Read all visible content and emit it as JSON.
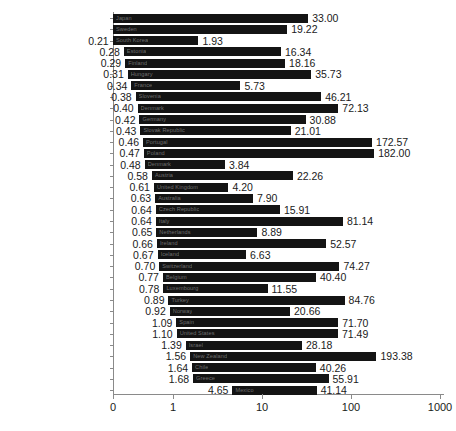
{
  "chart_data": {
    "type": "bar",
    "subtype": "floating-range-bar",
    "title": "",
    "xlabel": "",
    "ylabel": "",
    "orientation": "horizontal",
    "xscale": "log",
    "xlim": [
      0,
      1000
    ],
    "grid": false,
    "legend": null,
    "xticks": [
      {
        "label": "0",
        "value": 0,
        "px": 0
      },
      {
        "label": "1",
        "value": 1,
        "px": 60
      },
      {
        "label": "10",
        "value": 10,
        "px": 149
      },
      {
        "label": "100",
        "value": 100,
        "px": 238
      },
      {
        "label": "1000",
        "value": 1000,
        "px": 327
      }
    ],
    "categories": [
      "Japan",
      "Sweden",
      "South Korea",
      "Estonia",
      "Finland",
      "Hungary",
      "France",
      "Slovenia",
      "Canada",
      "Germany",
      "Slovak Republic",
      "Portugal",
      "Poland",
      "Denmark",
      "Austria",
      "United Kingdom",
      "Australia",
      "Czech Republic",
      "Italy",
      "Netherlands",
      "Ireland",
      "Iceland",
      "Switzerland",
      "Belgium",
      "Luxembourg",
      "Turkey",
      "Norway",
      "Spain",
      "United States",
      "Israel",
      "New Zealand",
      "Chile",
      "Greece",
      "Mexico"
    ],
    "series": [
      {
        "name": "Minimum",
        "values": [
          null,
          null,
          0.21,
          0.28,
          0.29,
          0.31,
          0.34,
          0.38,
          0.4,
          0.42,
          0.43,
          0.46,
          0.47,
          0.48,
          0.58,
          0.61,
          0.63,
          0.64,
          0.64,
          0.65,
          0.66,
          0.67,
          0.7,
          0.77,
          0.78,
          0.89,
          0.92,
          1.09,
          1.1,
          1.39,
          1.56,
          1.64,
          1.68,
          4.65
        ],
        "labels": [
          "",
          "",
          "0.21",
          "0.28",
          "0.29",
          "0.31",
          "0.34",
          "0.38",
          "0.40",
          "0.42",
          "0.43",
          "0.46",
          "0.47",
          "0.48",
          "0.58",
          "0.61",
          "0.63",
          "0.64",
          "0.64",
          "0.65",
          "0.66",
          "0.67",
          "0.70",
          "0.77",
          "0.78",
          "0.89",
          "0.92",
          "1.09",
          "1.10",
          "1.39",
          "1.56",
          "1.64",
          "1.68",
          "4.65"
        ]
      },
      {
        "name": "Maximum",
        "values": [
          33.0,
          19.22,
          1.93,
          16.34,
          18.16,
          35.73,
          5.73,
          46.21,
          72.13,
          30.88,
          21.01,
          172.57,
          182.0,
          3.84,
          22.26,
          4.2,
          7.9,
          15.91,
          81.14,
          8.89,
          52.57,
          6.63,
          74.27,
          40.4,
          11.55,
          84.76,
          20.66,
          71.7,
          71.49,
          28.18,
          193.38,
          40.26,
          55.91,
          41.14
        ],
        "labels": [
          "33.00",
          "19.22",
          "1.93",
          "16.34",
          "18.16",
          "35.73",
          "5.73",
          "46.21",
          "72.13",
          "30.88",
          "21.01",
          "172.57",
          "182.00",
          "3.84",
          "22.26",
          "4.20",
          "7.90",
          "15.91",
          "81.14",
          "8.89",
          "52.57",
          "6.63",
          "74.27",
          "40.40",
          "11.55",
          "84.76",
          "20.66",
          "71.70",
          "71.49",
          "28.18",
          "193.38",
          "40.26",
          "55.91",
          "41.14"
        ]
      }
    ],
    "bar_inner_labels": [
      "Japan",
      "Sweden",
      "South Korea",
      "Estonia",
      "Finland",
      "Hungary",
      "France",
      "Slovenia",
      "Denmark",
      "Germany",
      "Slovak Republic",
      "Portugal",
      "Poland",
      "Denmark",
      "Austria",
      "United Kingdom",
      "Australia",
      "Czech Republic",
      "Italy",
      "Netherlands",
      "Ireland",
      "Iceland",
      "Switzerland",
      "Belgium",
      "Luxembourg",
      "Turkey",
      "Norway",
      "Spain",
      "United States",
      "Israel",
      "New Zealand",
      "Chile",
      "Greece",
      "Mexico"
    ],
    "colors": {
      "bar": "#141414",
      "axis": "#8a8a8a",
      "text": "#1a1a1a",
      "inner_label": "#6e6e6e",
      "background": "#ffffff"
    }
  }
}
